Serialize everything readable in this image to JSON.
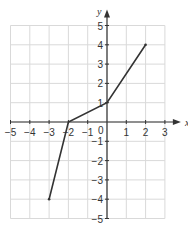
{
  "chart_data": {
    "type": "line",
    "title": "",
    "xlabel": "x",
    "ylabel": "y",
    "xlim": [
      -5,
      3
    ],
    "ylim": [
      -5,
      5
    ],
    "grid": true,
    "x_ticks": [
      "-5",
      "-4",
      "-3",
      "-2",
      "-1",
      "0",
      "1",
      "2",
      "3"
    ],
    "y_ticks": [
      "5",
      "4",
      "3",
      "2",
      "1",
      "-1",
      "-2",
      "-3",
      "-4",
      "-5"
    ],
    "origin_label": "0",
    "series": [
      {
        "name": "piecewise linear function",
        "points": [
          [
            -3,
            -4
          ],
          [
            -2,
            0
          ],
          [
            0,
            1
          ],
          [
            2,
            4
          ]
        ]
      }
    ]
  },
  "style": {
    "grid_color": "#d9d9d9",
    "axis_color": "#333333",
    "line_color": "#333333"
  }
}
